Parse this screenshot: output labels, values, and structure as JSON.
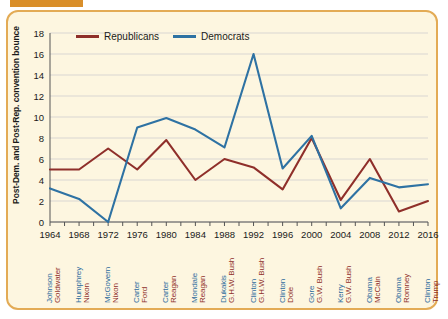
{
  "decor": {
    "top_bar_color": "#d98f2b",
    "card_bg": "#fdf6e0",
    "card_border": "#e3ab55"
  },
  "legend": {
    "position": "top-left-inside",
    "items": [
      {
        "label": "Republicans",
        "color": "#8f2f2a"
      },
      {
        "label": "Democrats",
        "color": "#2e72a3"
      }
    ]
  },
  "axis": {
    "ylabel": "Post-Dem. and Post-Rep. convention bounce",
    "yticks": [
      "0",
      "2",
      "4",
      "6",
      "8",
      "10",
      "12",
      "14",
      "16",
      "18"
    ],
    "xticks": [
      "1964",
      "1968",
      "1972",
      "1976",
      "1980",
      "1984",
      "1988",
      "1992",
      "1996",
      "2000",
      "2004",
      "2008",
      "2012",
      "2016"
    ]
  },
  "candidates": [
    {
      "year": "1964",
      "dem": "Johnson",
      "rep": "Goldwater"
    },
    {
      "year": "1968",
      "dem": "Humphrey",
      "rep": "Nixon"
    },
    {
      "year": "1972",
      "dem": "McGovern",
      "rep": "Nixon"
    },
    {
      "year": "1976",
      "dem": "Carter",
      "rep": "Ford"
    },
    {
      "year": "1980",
      "dem": "Carter",
      "rep": "Reagan"
    },
    {
      "year": "1984",
      "dem": "Mondale",
      "rep": "Reagan"
    },
    {
      "year": "1988",
      "dem": "Dukakis",
      "rep": "G.H.W. Bush"
    },
    {
      "year": "1992",
      "dem": "Clinton",
      "rep": "G.H.W. Bush"
    },
    {
      "year": "1996",
      "dem": "Clinton",
      "rep": "Dole"
    },
    {
      "year": "2000",
      "dem": "Gore",
      "rep": "G.W. Bush"
    },
    {
      "year": "2004",
      "dem": "Kerry",
      "rep": "G.W. Bush"
    },
    {
      "year": "2008",
      "dem": "Obama",
      "rep": "McCain"
    },
    {
      "year": "2012",
      "dem": "Obama",
      "rep": "Romney"
    },
    {
      "year": "2016",
      "dem": "Clinton",
      "rep": "Trump"
    }
  ],
  "chart_data": {
    "type": "line",
    "title": "",
    "xlabel": "",
    "ylabel": "Post-Dem. and Post-Rep. convention bounce",
    "categories": [
      "1964",
      "1968",
      "1972",
      "1976",
      "1980",
      "1984",
      "1988",
      "1992",
      "1996",
      "2000",
      "2004",
      "2008",
      "2012",
      "2016"
    ],
    "x": [
      1964,
      1968,
      1972,
      1976,
      1980,
      1984,
      1988,
      1992,
      1996,
      2000,
      2004,
      2008,
      2012,
      2016
    ],
    "xlim": [
      1964,
      2016
    ],
    "ylim": [
      0,
      18
    ],
    "ytick_step": 2,
    "grid": "horizontal",
    "legend_position": "upper-left-inside",
    "series": [
      {
        "name": "Republicans",
        "color": "#8f2f2a",
        "values": [
          5.0,
          5.0,
          7.0,
          5.0,
          7.8,
          4.0,
          6.0,
          5.2,
          3.1,
          8.0,
          2.1,
          6.0,
          1.0,
          2.0
        ]
      },
      {
        "name": "Democrats",
        "color": "#2e72a3",
        "values": [
          3.2,
          2.2,
          0.0,
          9.0,
          9.9,
          8.8,
          7.1,
          16.0,
          5.1,
          8.2,
          1.3,
          4.2,
          3.3,
          3.6
        ]
      }
    ]
  }
}
